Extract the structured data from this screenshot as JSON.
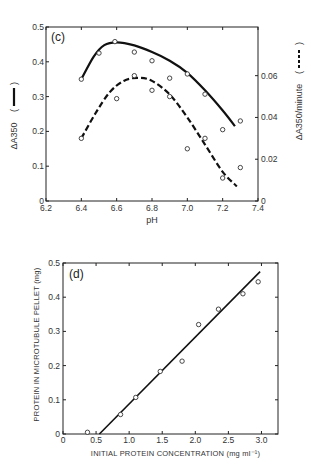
{
  "chart_data": [
    {
      "type": "scatter",
      "panel_label": "(c)",
      "title": "",
      "xlabel": "pH",
      "ylabel_left": "ΔA350",
      "ylabel_left_legend": "solid line",
      "ylabel_right": "ΔA350/minute",
      "ylabel_right_legend": "dashed line",
      "xlim": [
        6.2,
        7.4
      ],
      "ylim_left": [
        0,
        0.5
      ],
      "ylim_right": [
        0,
        0.0833
      ],
      "x_ticks": [
        "6.2",
        "6.4",
        "6.6",
        "6.8",
        "7.0",
        "7.2",
        "7.4"
      ],
      "y_ticks_left": [
        "0",
        "0.1",
        "0.2",
        "0.3",
        "0.4",
        "0.5"
      ],
      "y_ticks_right": [
        "0",
        "0.02",
        "0.04",
        "0.06"
      ],
      "grid": false,
      "series": [
        {
          "name": "ΔA350",
          "axis": "left",
          "line_style": "solid",
          "points": [
            [
              6.4,
              0.35
            ],
            [
              6.5,
              0.425
            ],
            [
              6.59,
              0.458
            ],
            [
              6.7,
              0.428
            ],
            [
              6.8,
              0.403
            ],
            [
              6.9,
              0.353
            ],
            [
              7.0,
              0.365
            ],
            [
              7.1,
              0.307
            ],
            [
              7.2,
              0.205
            ],
            [
              7.3,
              0.23
            ]
          ],
          "fit": [
            [
              6.4,
              0.35
            ],
            [
              6.47,
              0.415
            ],
            [
              6.53,
              0.448
            ],
            [
              6.6,
              0.456
            ],
            [
              6.7,
              0.447
            ],
            [
              6.8,
              0.428
            ],
            [
              6.9,
              0.403
            ],
            [
              7.0,
              0.368
            ],
            [
              7.1,
              0.318
            ],
            [
              7.2,
              0.26
            ],
            [
              7.27,
              0.215
            ]
          ]
        },
        {
          "name": "ΔA350/minute",
          "axis": "right",
          "line_style": "dashed",
          "points": [
            [
              6.4,
              0.03
            ],
            [
              6.6,
              0.049
            ],
            [
              6.7,
              0.06
            ],
            [
              6.8,
              0.053
            ],
            [
              6.9,
              0.05
            ],
            [
              7.0,
              0.025
            ],
            [
              7.1,
              0.03
            ],
            [
              7.2,
              0.011
            ],
            [
              7.3,
              0.016
            ]
          ],
          "fit": [
            [
              6.4,
              0.03
            ],
            [
              6.48,
              0.042
            ],
            [
              6.56,
              0.052
            ],
            [
              6.64,
              0.0575
            ],
            [
              6.72,
              0.059
            ],
            [
              6.8,
              0.0575
            ],
            [
              6.9,
              0.051
            ],
            [
              7.0,
              0.04
            ],
            [
              7.1,
              0.027
            ],
            [
              7.2,
              0.014
            ],
            [
              7.28,
              0.007
            ]
          ]
        }
      ]
    },
    {
      "type": "scatter",
      "panel_label": "(d)",
      "title": "",
      "xlabel": "INITIAL PROTEIN CONCENTRATION  (mg ml⁻¹)",
      "ylabel": "PROTEIN IN MICROTUBULE PELLET  (mg)",
      "xlim": [
        0,
        3.25
      ],
      "ylim": [
        0,
        0.5
      ],
      "x_ticks": [
        "0",
        "0.5",
        "1.0",
        "1.5",
        "2.0",
        "2.5",
        "3.0"
      ],
      "y_ticks": [
        "0",
        "0.1",
        "0.2",
        "0.3",
        "0.4",
        "0.5"
      ],
      "grid": false,
      "series": [
        {
          "name": "pellet protein",
          "line_style": "solid",
          "points": [
            [
              0.37,
              0.005
            ],
            [
              0.87,
              0.057
            ],
            [
              1.1,
              0.107
            ],
            [
              1.47,
              0.183
            ],
            [
              1.8,
              0.213
            ],
            [
              2.05,
              0.32
            ],
            [
              2.35,
              0.365
            ],
            [
              2.72,
              0.41
            ],
            [
              2.95,
              0.445
            ]
          ],
          "fit": [
            [
              0.55,
              0.0
            ],
            [
              2.98,
              0.475
            ]
          ]
        }
      ]
    }
  ]
}
